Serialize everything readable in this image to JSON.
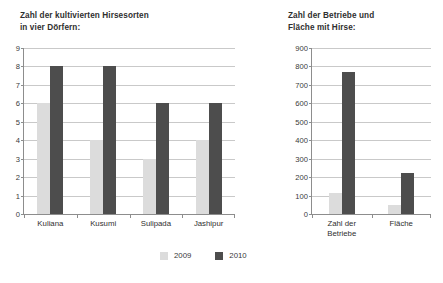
{
  "figure": {
    "background": "#ffffff",
    "series_colors": {
      "s2009": "#dcdcdc",
      "s2010": "#4d4d4d"
    }
  },
  "legend": {
    "items": [
      {
        "label": "2009",
        "color": "#dcdcdc"
      },
      {
        "label": "2010",
        "color": "#4d4d4d"
      }
    ]
  },
  "left": {
    "title": "Zahl der kultivierten Hirsesorten\nin vier Dörfern:",
    "yticks": [
      "0",
      "1",
      "2",
      "3",
      "4",
      "5",
      "6",
      "7",
      "8",
      "9"
    ],
    "categories": [
      "Kuliana",
      "Kusumi",
      "Sulipada",
      "Jashipur"
    ]
  },
  "right": {
    "title": "Zahl der Betriebe und\nFläche mit Hirse:",
    "yticks": [
      "0",
      "100",
      "200",
      "300",
      "400",
      "500",
      "600",
      "700",
      "800",
      "900"
    ],
    "categories": [
      "Zahl der\nBetriebe",
      "Fläche"
    ]
  },
  "chart_data": [
    {
      "type": "bar",
      "id": "left",
      "title": "Zahl der kultivierten Hirsesorten in vier Dörfern:",
      "xlabel": "",
      "ylabel": "",
      "ylim": [
        0,
        9
      ],
      "ytick_step": 1,
      "grid": true,
      "legend_position": "bottom-center",
      "categories": [
        "Kuliana",
        "Kusumi",
        "Sulipada",
        "Jashipur"
      ],
      "series": [
        {
          "name": "2009",
          "color": "#dcdcdc",
          "values": [
            6,
            4,
            3,
            4
          ]
        },
        {
          "name": "2010",
          "color": "#4d4d4d",
          "values": [
            8,
            8,
            6,
            6
          ]
        }
      ]
    },
    {
      "type": "bar",
      "id": "right",
      "title": "Zahl der Betriebe und Fläche mit Hirse:",
      "xlabel": "",
      "ylabel": "",
      "ylim": [
        0,
        900
      ],
      "ytick_step": 100,
      "grid": true,
      "legend_position": "bottom-center",
      "categories": [
        "Zahl der Betriebe",
        "Fläche"
      ],
      "series": [
        {
          "name": "2009",
          "color": "#dcdcdc",
          "values": [
            115,
            50
          ]
        },
        {
          "name": "2010",
          "color": "#4d4d4d",
          "values": [
            770,
            225
          ]
        }
      ]
    }
  ]
}
